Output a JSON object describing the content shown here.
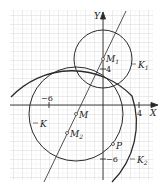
{
  "axes": {
    "x_label": "X",
    "y_label": "Y",
    "x_tick_pos": "4",
    "x_tick_neg": "−6",
    "y_tick_pos": "4",
    "y_tick_neg": "−6"
  },
  "points": {
    "M1": "M",
    "M1_sub": "1",
    "M": "M",
    "M2": "M",
    "M2_sub": "2",
    "P": "P"
  },
  "circles": {
    "K": "K",
    "K1": "K",
    "K1_sub": "1",
    "K2": "K",
    "K2_sub": "2"
  },
  "colors": {
    "ink": "#2a2a2a",
    "grid_minor": "#e3e3e3",
    "grid_major": "#c8c8c8"
  }
}
